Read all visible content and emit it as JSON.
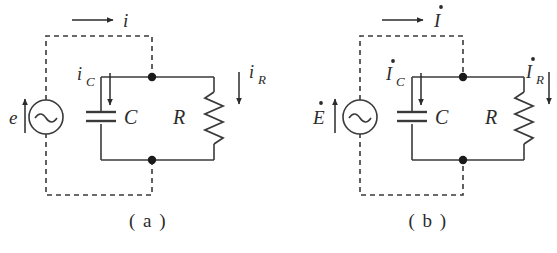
{
  "figure": {
    "type": "circuit-diagram-pair",
    "background_color": "#ffffff",
    "line_color": "#3a3a3a",
    "text_color": "#2b2b2b"
  },
  "panels": [
    {
      "id": "a",
      "caption": "( a )",
      "source_label": "e",
      "total_current_label": "i",
      "capacitor_current_label": "i",
      "capacitor_current_sub": "C",
      "resistor_current_label": "i",
      "resistor_current_sub": "R",
      "capacitor_label": "C",
      "resistor_label": "R",
      "source_symbol": "~",
      "phasor": false
    },
    {
      "id": "b",
      "caption": "( b )",
      "source_label": "E",
      "total_current_label": "I",
      "capacitor_current_label": "I",
      "capacitor_current_sub": "C",
      "resistor_current_label": "I",
      "resistor_current_sub": "R",
      "capacitor_label": "C",
      "resistor_label": "R",
      "source_symbol": "~",
      "phasor": true
    }
  ]
}
